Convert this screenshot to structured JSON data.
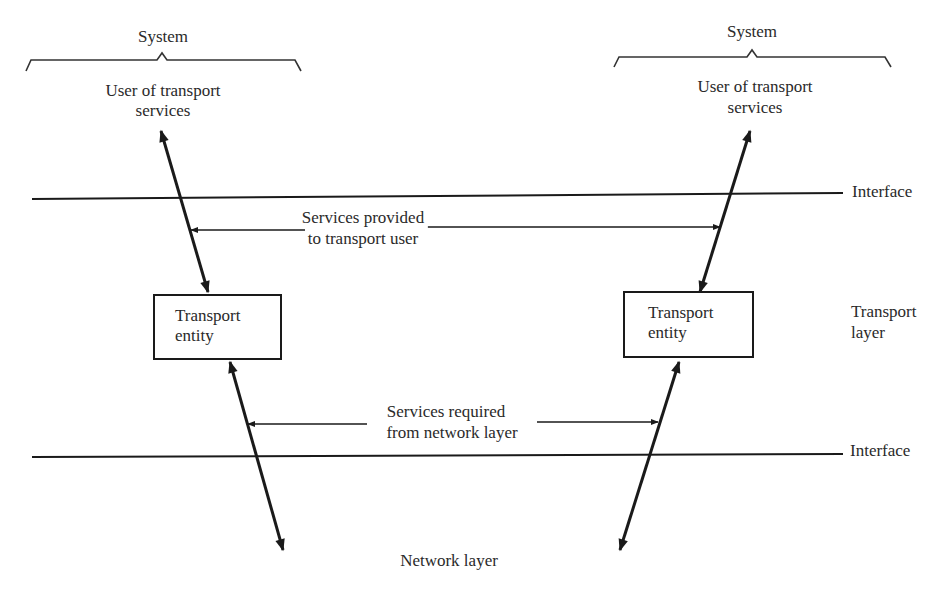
{
  "diagram": {
    "left_system": {
      "brace_label": "System",
      "user_label_line1": "User of transport",
      "user_label_line2": "services",
      "entity_line1": "Transport",
      "entity_line2": "entity"
    },
    "right_system": {
      "brace_label": "System",
      "user_label_line1": "User of transport",
      "user_label_line2": "services",
      "entity_line1": "Transport",
      "entity_line2": "entity"
    },
    "upper_interface_label": "Interface",
    "lower_interface_label": "Interface",
    "transport_layer_line1": "Transport",
    "transport_layer_line2": "layer",
    "services_provided_line1": "Services provided",
    "services_provided_line2": "to transport user",
    "services_required_line1": "Services required",
    "services_required_line2": "from network layer",
    "network_layer_label": "Network layer",
    "colors": {
      "ink": "#1a1a1a",
      "text": "#2a2a2a",
      "background": "#ffffff"
    }
  }
}
